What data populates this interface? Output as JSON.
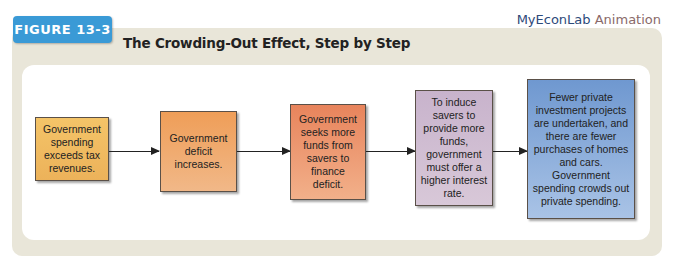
{
  "brand": {
    "name": "MyEconLab",
    "suffix": "Animation"
  },
  "figure": {
    "label": "FIGURE 13-3",
    "title": "The Crowding-Out Effect, Step by Step"
  },
  "steps": [
    {
      "text": "Government spending exceeds tax revenues.",
      "color": "#f0b75e"
    },
    {
      "text": "Government deficit increases.",
      "color": "#ec9a5a"
    },
    {
      "text": "Government seeks more funds from savers to finance deficit.",
      "color": "#e98d62"
    },
    {
      "text": "To induce savers to provide more funds, government must offer a higher interest rate.",
      "color": "#cdb8cf"
    },
    {
      "text": "Fewer private investment projects are undertaken, and there are fewer purchases of homes and cars. Government spending crowds out private spending.",
      "color": "#7ea4d6"
    }
  ]
}
